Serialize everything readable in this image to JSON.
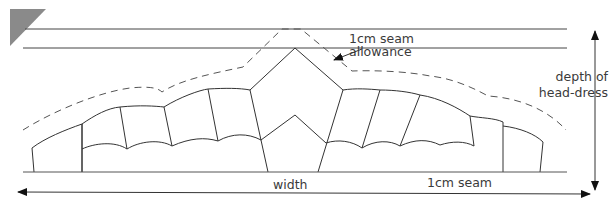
{
  "diagram": {
    "type": "pattern-diagram",
    "labels": {
      "seam_allowance_line1": "1cm seam",
      "seam_allowance_line2": "allowance",
      "depth_line1": "depth of",
      "depth_line2": "head-dress",
      "width": "width",
      "bottom_seam": "1cm seam"
    },
    "colors": {
      "line": "#333333",
      "dashed_line": "#555555",
      "corner_marker": "#8a8a8a",
      "text": "#3a3a3a"
    }
  }
}
